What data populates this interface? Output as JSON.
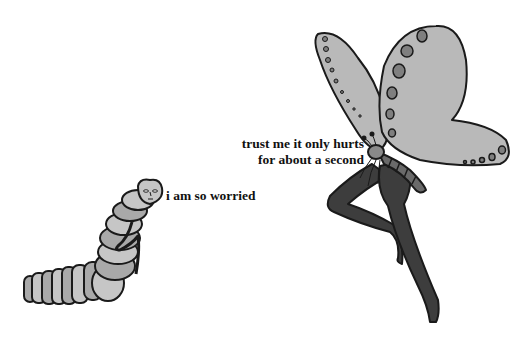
{
  "comic": {
    "style": "grayscale single-panel meme",
    "colors": {
      "background": "#ffffff",
      "outline": "#1a1a1a",
      "wing_fill": "#b9b9b9",
      "wing_spots": "#7f7f7f",
      "caterpillar_body": "#a9a9a9",
      "caterpillar_light": "#c6c6c6",
      "legs": "#3d3d3d",
      "text": "#111111"
    },
    "characters": [
      {
        "name": "caterpillar",
        "speech": "i am so worried"
      },
      {
        "name": "butterfly-with-human-legs",
        "speech_lines": [
          "trust me it only hurts",
          "for about a second"
        ]
      }
    ]
  }
}
